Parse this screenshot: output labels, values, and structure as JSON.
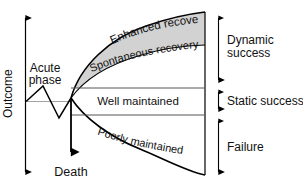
{
  "figure": {
    "axis": {
      "y_label": "Outcome",
      "origin_label": "Death"
    },
    "phases": {
      "acute_phase_label": "Acute\nphase",
      "acute_phase_line1": "Acute",
      "acute_phase_line2": "phase"
    },
    "bands": [
      {
        "id": "enhanced-recovery",
        "label": "Enhanced recovery",
        "shaded": true,
        "fill": "#d2d2d2"
      },
      {
        "id": "spontaneous-recovery",
        "label": "Spontaneous recovery",
        "shaded": false,
        "fill": "#ffffff"
      },
      {
        "id": "well-maintained",
        "label": "Well maintained",
        "shaded": false,
        "fill": "#ffffff"
      },
      {
        "id": "poorly-maintained",
        "label": "Poorly maintained",
        "shaded": false,
        "fill": "#ffffff"
      }
    ],
    "brackets": [
      {
        "id": "dynamic-success",
        "label": "Dynamic success",
        "line1": "Dynamic",
        "line2": "success"
      },
      {
        "id": "static-success",
        "label": "Static success",
        "line1": "Static success",
        "line2": ""
      },
      {
        "id": "failure",
        "label": "Failure",
        "line1": "Failure",
        "line2": ""
      }
    ],
    "colors": {
      "stroke": "#000000",
      "thin_stroke": "#555555",
      "shade": "#d2d2d2",
      "background": "#ffffff"
    }
  }
}
